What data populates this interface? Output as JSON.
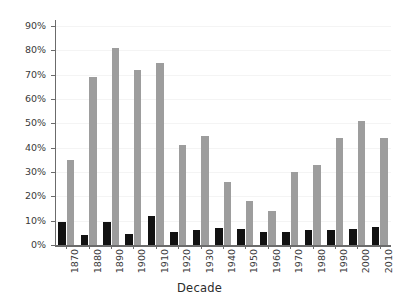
{
  "chart_data": {
    "type": "bar",
    "title": "",
    "subtitle": "",
    "xlabel": "Decade",
    "ylabel": "",
    "categories": [
      "1870",
      "1880",
      "1890",
      "1900",
      "1910",
      "1920",
      "1930",
      "1940",
      "1950",
      "1960",
      "1970",
      "1980",
      "1990",
      "2000",
      "2010"
    ],
    "series": [
      {
        "name": "series-1",
        "color": "#121212",
        "values": [
          9.5,
          4.0,
          9.5,
          4.5,
          12.0,
          5.5,
          6.0,
          7.0,
          6.5,
          5.5,
          5.5,
          6.0,
          6.0,
          6.5,
          7.5
        ]
      },
      {
        "name": "series-2",
        "color": "#9d9d9d",
        "values": [
          35,
          69,
          81,
          72,
          75,
          41,
          45,
          26,
          18,
          14,
          30,
          33,
          44,
          51,
          44
        ]
      }
    ],
    "ytick_labels": [
      "0%",
      "10%",
      "20%",
      "30%",
      "40%",
      "50%",
      "60%",
      "70%",
      "80%",
      "90%"
    ],
    "ytick_values": [
      0,
      10,
      20,
      30,
      40,
      50,
      60,
      70,
      80,
      90
    ],
    "ylim": [
      0,
      93
    ],
    "grid": "horizontal-faint",
    "legend": "none",
    "value_suffix": "%"
  },
  "colors": {
    "background": "#ffffff",
    "axis": "#6b6b6b",
    "tick_text": "#3a3a3a",
    "axis_label_text": "#2b2b2b",
    "gridline": "#f4f4f4",
    "series_1": "#121212",
    "series_2": "#9d9d9d"
  }
}
